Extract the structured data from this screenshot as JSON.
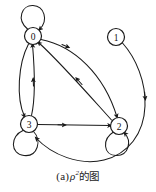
{
  "figure": {
    "type": "directed-graph",
    "caption": {
      "prefix": "(a)",
      "symbol": "ρ",
      "superscript": "2",
      "suffix": "的图",
      "full_text": "(a) ρ²的图"
    },
    "stroke_color": "#1a1a1a",
    "node_fill": "#ffffff",
    "background": "#ffffff"
  },
  "graph": {
    "nodes": [
      {
        "id": "n0",
        "label": "0",
        "cx": 33,
        "cy": 36,
        "r": 8.5
      },
      {
        "id": "n1",
        "label": "1",
        "cx": 116,
        "cy": 37,
        "r": 8.5
      },
      {
        "id": "n2",
        "label": "2",
        "cx": 119,
        "cy": 126,
        "r": 8.5
      },
      {
        "id": "n3",
        "label": "3",
        "cx": 29,
        "cy": 124,
        "r": 8.5
      }
    ],
    "self_loops": [
      {
        "node": "0",
        "position": "above"
      },
      {
        "node": "2",
        "position": "below"
      },
      {
        "node": "3",
        "position": "below-left"
      }
    ],
    "edges": [
      {
        "from": "0",
        "to": "0",
        "kind": "self-loop"
      },
      {
        "from": "0",
        "to": "2",
        "kind": "curved"
      },
      {
        "from": "2",
        "to": "0",
        "kind": "curved"
      },
      {
        "from": "0",
        "to": "3",
        "kind": "curved"
      },
      {
        "from": "3",
        "to": "0",
        "kind": "curved"
      },
      {
        "from": "3",
        "to": "2",
        "kind": "straight"
      },
      {
        "from": "2",
        "to": "2",
        "kind": "self-loop"
      },
      {
        "from": "3",
        "to": "3",
        "kind": "self-loop"
      },
      {
        "from": "1",
        "to": "3",
        "kind": "long-curve"
      }
    ]
  }
}
